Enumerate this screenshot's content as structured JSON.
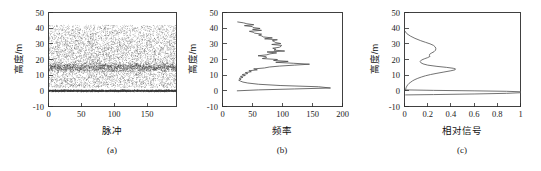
{
  "figure": {
    "background": "#ffffff",
    "ink_color": "#2b2b2b",
    "curve_color": "#5a5a5a"
  },
  "chart_data": [
    {
      "type": "scatter",
      "panel_tag": "(a)",
      "title": "",
      "xlabel": "脉冲",
      "ylabel": "高度/m",
      "xlim": [
        0,
        195
      ],
      "ylim": [
        -10,
        50
      ],
      "xticks": [
        0,
        50,
        100,
        150
      ],
      "yticks": [
        -10,
        0,
        10,
        20,
        30,
        40,
        50
      ],
      "grid": false,
      "legend": "none",
      "description": "Dense point cloud of lidar returns: broad canopy scatter from ~2 m to ~42 m with a dense sub-band near 15 m, plus a very dense ground return line at 0 m.",
      "bands": [
        {
          "name": "canopy-scatter",
          "y_min": 2,
          "y_max": 42,
          "density": "medium"
        },
        {
          "name": "canopy-peak-band",
          "y_min": 12,
          "y_max": 18,
          "density": "high"
        },
        {
          "name": "ground-return",
          "y_min": -0.6,
          "y_max": 0.6,
          "density": "very-high"
        }
      ],
      "n_points_approx": 6000
    },
    {
      "type": "line",
      "panel_tag": "(b)",
      "title": "",
      "xlabel": "频率",
      "ylabel": "高度/m",
      "xlim": [
        0,
        200
      ],
      "ylim": [
        -10,
        50
      ],
      "xticks": [
        0,
        50,
        100,
        150,
        200
      ],
      "yticks": [
        -10,
        0,
        10,
        20,
        30,
        40,
        50
      ],
      "grid": false,
      "legend": "none",
      "orientation": "horizontal-profile",
      "description": "Height-frequency histogram profile (frequency on x, height on y). Large ground spike to ~180 near 1 m, canopy peak ~145 near 16.5 m, jagged mid-canopy values 50-105 between 20 m and 44 m.",
      "y": [
        0.0,
        0.6,
        1.2,
        1.8,
        2.6,
        3.4,
        4.2,
        5.0,
        5.6,
        6.2,
        6.8,
        7.4,
        8.0,
        8.6,
        9.2,
        9.8,
        10.4,
        11.0,
        11.6,
        12.2,
        12.8,
        13.4,
        14.0,
        14.6,
        15.2,
        15.8,
        16.4,
        17.0,
        17.6,
        18.2,
        18.8,
        19.4,
        20.0,
        20.6,
        21.2,
        21.8,
        22.4,
        23.0,
        23.6,
        24.2,
        24.8,
        25.4,
        26.0,
        26.6,
        27.2,
        27.8,
        28.4,
        29.0,
        29.6,
        30.2,
        30.8,
        31.4,
        32.0,
        32.6,
        33.2,
        33.8,
        34.4,
        35.0,
        35.6,
        36.2,
        36.8,
        37.4,
        38.0,
        38.6,
        39.2,
        39.8,
        40.4,
        41.0,
        41.6,
        42.2,
        42.8,
        43.4,
        44.0
      ],
      "x": [
        24,
        60,
        120,
        180,
        160,
        96,
        60,
        42,
        34,
        30,
        27,
        31,
        28,
        34,
        30,
        38,
        33,
        42,
        38,
        48,
        44,
        58,
        52,
        70,
        78,
        95,
        120,
        145,
        118,
        96,
        104,
        88,
        96,
        70,
        66,
        78,
        70,
        84,
        76,
        90,
        80,
        94,
        84,
        100,
        88,
        104,
        92,
        102,
        86,
        98,
        80,
        92,
        74,
        84,
        68,
        78,
        62,
        72,
        58,
        66,
        54,
        62,
        50,
        56,
        46,
        52,
        42,
        48,
        38,
        42,
        34,
        30,
        23
      ]
    },
    {
      "type": "line",
      "panel_tag": "(c)",
      "title": "",
      "xlabel": "相对信号",
      "ylabel": "高度/m",
      "xlim": [
        0.0,
        1.0
      ],
      "ylim": [
        -10,
        50
      ],
      "xticks": [
        0.0,
        0.2,
        0.4,
        0.6,
        0.8,
        1.0
      ],
      "yticks": [
        -10,
        0,
        10,
        20,
        30,
        40,
        50
      ],
      "grid": false,
      "legend": "none",
      "orientation": "horizontal-profile",
      "description": "Smoothed relative waveform: near-zero above 38 m, broad canopy shoulder ~0.27 at 26 m, sharp canopy peak ~0.44 at 14 m, decay to near 0 at 4 m, then two narrow ground returns converging to 1.0 at 0 m and -2 m.",
      "series": [
        {
          "name": "waveform",
          "y": [
            38.0,
            36.5,
            35.0,
            33.5,
            32.0,
            31.0,
            30.0,
            29.0,
            28.0,
            27.0,
            26.0,
            25.0,
            24.0,
            23.2,
            22.6,
            22.0,
            21.2,
            20.4,
            19.6,
            18.8,
            18.0,
            17.2,
            16.4,
            15.6,
            15.0,
            14.4,
            14.0,
            13.4,
            12.8,
            12.0,
            11.2,
            10.4,
            9.6,
            8.8,
            8.0,
            7.2,
            6.4,
            5.6,
            4.8,
            4.0,
            3.0,
            2.0,
            1.0,
            0.4
          ],
          "values": [
            0.005,
            0.02,
            0.05,
            0.09,
            0.14,
            0.18,
            0.22,
            0.25,
            0.265,
            0.27,
            0.268,
            0.255,
            0.23,
            0.215,
            0.215,
            0.22,
            0.2,
            0.17,
            0.145,
            0.135,
            0.14,
            0.16,
            0.2,
            0.28,
            0.36,
            0.42,
            0.44,
            0.435,
            0.4,
            0.34,
            0.28,
            0.225,
            0.18,
            0.145,
            0.115,
            0.09,
            0.07,
            0.055,
            0.04,
            0.03,
            0.02,
            0.014,
            0.01,
            0.008
          ]
        },
        {
          "name": "ground-return-upper",
          "y": [
            0.6,
            0.3,
            0.0,
            -0.3,
            -0.6
          ],
          "values": [
            0.01,
            0.25,
            0.6,
            0.88,
            1.0
          ]
        },
        {
          "name": "ground-return-lower",
          "y": [
            -2.6,
            -2.4,
            -2.0,
            -1.6,
            -1.2
          ],
          "values": [
            0.01,
            0.25,
            0.6,
            0.88,
            1.0
          ]
        }
      ]
    }
  ]
}
